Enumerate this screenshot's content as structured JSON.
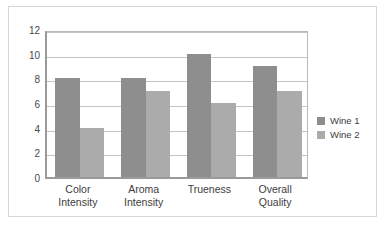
{
  "chart_data": {
    "type": "bar",
    "title": "",
    "subtitle": "",
    "xlabel": "",
    "ylabel": "",
    "categories": [
      "Color Intensity",
      "Aroma Intensity",
      "Trueness",
      "Overall Quality"
    ],
    "category_lines": [
      [
        "Color",
        "Intensity"
      ],
      [
        "Aroma",
        "Intensity"
      ],
      [
        "Trueness",
        ""
      ],
      [
        "Overall",
        "Quality"
      ]
    ],
    "series": [
      {
        "name": "Wine 1",
        "values": [
          8,
          8,
          10,
          9
        ],
        "color": "#8e8e8e"
      },
      {
        "name": "Wine 2",
        "values": [
          4,
          7,
          6,
          7
        ],
        "color": "#ababab"
      }
    ],
    "ylim": [
      0,
      12
    ],
    "yticks": [
      0,
      2,
      4,
      6,
      8,
      10,
      12
    ],
    "ytick_labels": [
      "0",
      "2",
      "4",
      "6",
      "8",
      "10",
      "12"
    ],
    "grid": true,
    "grid_axis": "y",
    "legend_position": "right",
    "legend_entries": [
      "Wine 1",
      "Wine 2"
    ]
  },
  "frame": {
    "border_color": "#d6d6d6",
    "background": "#ffffff"
  }
}
